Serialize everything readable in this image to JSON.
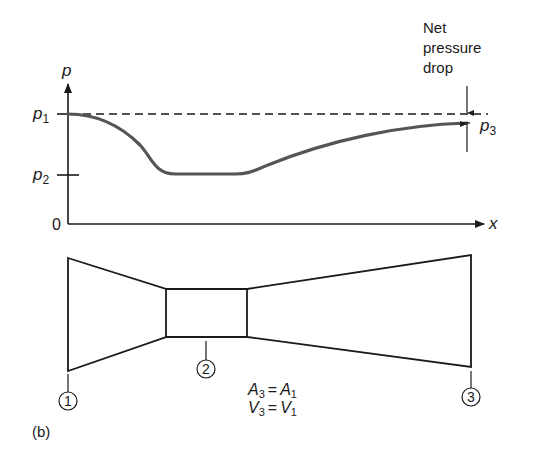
{
  "figure": {
    "panel_label": "(b)",
    "colors": {
      "ink": "#1a1a1a",
      "curve": "#555555",
      "background": "#ffffff"
    }
  },
  "plot": {
    "y_axis_label": "p",
    "x_axis_label": "x",
    "origin_label": "0",
    "levels": [
      {
        "name": "p1",
        "base": "p",
        "sub": "1"
      },
      {
        "name": "p2",
        "base": "p",
        "sub": "2"
      },
      {
        "name": "p3",
        "base": "p",
        "sub": "3"
      }
    ],
    "annotation": {
      "lines": [
        "Net",
        "pressure",
        "drop"
      ]
    }
  },
  "venturi": {
    "stations": [
      {
        "id": "1",
        "label": "1"
      },
      {
        "id": "2",
        "label": "2"
      },
      {
        "id": "3",
        "label": "3"
      }
    ],
    "equations": [
      {
        "lhs_base": "A",
        "lhs_sub": "3",
        "op": "=",
        "rhs_base": "A",
        "rhs_sub": "1"
      },
      {
        "lhs_base": "V",
        "lhs_sub": "3",
        "op": "=",
        "rhs_base": "V",
        "rhs_sub": "1"
      }
    ]
  }
}
